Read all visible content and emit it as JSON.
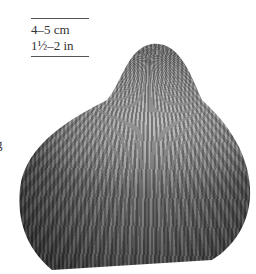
{
  "image": {
    "subject": "cockle shell",
    "background_color": "#ffffff",
    "shell_colors": [
      "#2a2a2a",
      "#6e6e6e",
      "#b9b9b9"
    ]
  },
  "scale_label": {
    "metric": "4–5 cm",
    "imperial": "1½–2 in"
  },
  "edge_text": {
    "clipped_glyph": "g"
  }
}
